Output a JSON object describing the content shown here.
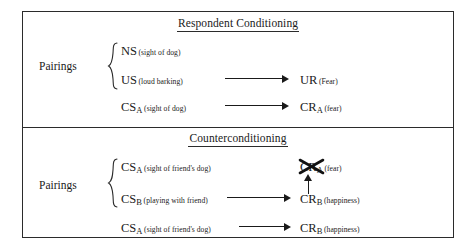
{
  "diagram": {
    "title_respondent": "Respondent Conditioning",
    "title_counter": "Counterconditioning",
    "pairings_label": "Pairings",
    "respondent": {
      "ns": {
        "symbol": "NS",
        "sub": "",
        "descriptor": "(sight of dog)"
      },
      "us": {
        "symbol": "US",
        "sub": "",
        "descriptor": "(loud barking)"
      },
      "ur": {
        "symbol": "UR",
        "sub": "",
        "descriptor": "(Fear)"
      },
      "cs_a": {
        "symbol": "CS",
        "sub": "A",
        "descriptor": "(sight of dog)"
      },
      "cr_a": {
        "symbol": "CR",
        "sub": "A",
        "descriptor": "(fear)"
      }
    },
    "counter": {
      "cs_a_top": {
        "symbol": "CS",
        "sub": "A",
        "descriptor": "(sight of friend's dog)"
      },
      "cr_a_crossed": {
        "symbol": "CR",
        "sub": "A",
        "descriptor": "(fear)"
      },
      "cs_b": {
        "symbol": "CS",
        "sub": "B",
        "descriptor": "(playing with friend)"
      },
      "cr_b": {
        "symbol": "CR",
        "sub": "B",
        "descriptor": "(happiness)"
      },
      "cs_a_bottom": {
        "symbol": "CS",
        "sub": "A",
        "descriptor": "(sight of friend's dog)"
      },
      "cr_b_bottom": {
        "symbol": "CR",
        "sub": "B",
        "descriptor": "(happiness)"
      }
    }
  }
}
